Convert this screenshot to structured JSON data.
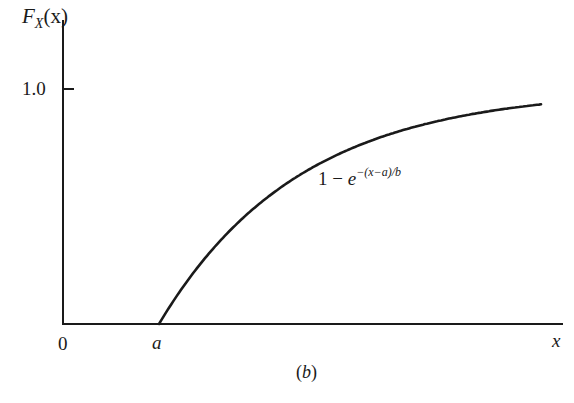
{
  "chart_data": {
    "type": "line",
    "title": "",
    "caption": "(b)",
    "xlabel": "x",
    "ylabel": "F_X(x)",
    "x_ticks": [
      {
        "label": "0",
        "value": 0
      },
      {
        "label": "a",
        "value": "a"
      }
    ],
    "y_ticks": [
      {
        "label": "1.0",
        "value": 1.0
      }
    ],
    "ylim": [
      0,
      1.0
    ],
    "grid": false,
    "legend": null,
    "series": [
      {
        "name": "1 - e^{-(x-a)/b}",
        "description": "Exponential CDF: zero for x < a, rises as 1 - exp(-(x-a)/b) for x >= a, approaching 1.0 asymptotically",
        "points_normalized": [
          {
            "x": "a",
            "y": 0.0
          },
          {
            "x": "a + 0.5b",
            "y": 0.39
          },
          {
            "x": "a + b",
            "y": 0.63
          },
          {
            "x": "a + 2b",
            "y": 0.86
          },
          {
            "x": "a + 2.7b",
            "y": 0.93
          }
        ]
      }
    ],
    "annotations": [
      {
        "text": "1 − e^{−(x−a)/b}",
        "position": "below curve, center"
      }
    ]
  },
  "labels": {
    "y_axis_main": "F",
    "y_axis_sub": "X",
    "y_axis_arg": "(x)",
    "y_tick_1": "1.0",
    "x_tick_0": "0",
    "x_tick_a": "a",
    "x_axis": "x",
    "caption_open": "(",
    "caption_letter": "b",
    "caption_close": ")",
    "formula_one": "1 − ",
    "formula_e": "e",
    "formula_exp": "−(x−a)/b"
  },
  "colors": {
    "ink": "#1a1a1a",
    "background": "#ffffff"
  }
}
